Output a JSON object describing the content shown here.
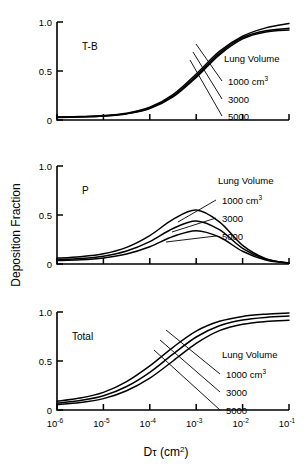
{
  "figure": {
    "y_axis_label": "Deposition Fraction",
    "x_axis_label_main": "D",
    "x_axis_label_tau": "τ",
    "x_axis_label_units_open": "(cm",
    "x_axis_label_units_exp": "2",
    "x_axis_label_units_close": ")"
  },
  "legend": {
    "title": "Lung Volume",
    "items": [
      {
        "label": "1000 cm",
        "sup": "3"
      },
      {
        "label": "3000",
        "sup": ""
      },
      {
        "label": "5000",
        "sup": ""
      }
    ]
  },
  "y_ticks": [
    "1.0",
    "0.5",
    "0"
  ],
  "x_ticks": [
    {
      "base": "10",
      "exp": "-6"
    },
    {
      "base": "10",
      "exp": "-5"
    },
    {
      "base": "10",
      "exp": "-4"
    },
    {
      "base": "10",
      "exp": "-3"
    },
    {
      "base": "10",
      "exp": "-2"
    },
    {
      "base": "10",
      "exp": "-1"
    }
  ],
  "panels": [
    {
      "name": "T-B",
      "label": "T-B"
    },
    {
      "name": "P",
      "label": "P"
    },
    {
      "name": "Total",
      "label": "Total"
    }
  ],
  "colors": {
    "line": "#000000",
    "axis": "#000000",
    "background": "#ffffff"
  },
  "chart_data": {
    "type": "line",
    "title": "",
    "xlabel": "Dτ (cm2)",
    "ylabel": "Deposition Fraction",
    "xscale": "log",
    "xlim": [
      1e-06,
      0.1
    ],
    "ylim": [
      0,
      1.0
    ],
    "xtick_values": [
      1e-06,
      1e-05,
      0.0001,
      0.001,
      0.01,
      0.1
    ],
    "ytick_values": [
      0,
      0.5,
      1.0
    ],
    "grid": false,
    "legend_position": "right-inside",
    "panels": [
      {
        "panel": "T-B",
        "annotation": "T-B",
        "x": [
          1e-06,
          3.16e-06,
          1e-05,
          3.16e-05,
          0.0001,
          0.000316,
          0.001,
          0.00316,
          0.01,
          0.0316,
          0.1
        ],
        "series": [
          {
            "name": "1000 cm3",
            "values": [
              0.03,
              0.035,
              0.045,
              0.07,
              0.13,
              0.26,
              0.47,
              0.7,
              0.855,
              0.94,
              0.985
            ]
          },
          {
            "name": "3000",
            "values": [
              0.028,
              0.033,
              0.042,
              0.065,
              0.122,
              0.245,
              0.45,
              0.68,
              0.84,
              0.91,
              0.935
            ]
          },
          {
            "name": "5000",
            "values": [
              0.026,
              0.031,
              0.04,
              0.062,
              0.116,
              0.235,
              0.435,
              0.665,
              0.828,
              0.898,
              0.918
            ]
          }
        ]
      },
      {
        "panel": "P",
        "annotation": "P",
        "x": [
          1e-06,
          3.16e-06,
          1e-05,
          3.16e-05,
          0.0001,
          0.000316,
          0.001,
          0.00316,
          0.01,
          0.0316,
          0.1
        ],
        "series": [
          {
            "name": "1000 cm3",
            "values": [
              0.06,
              0.075,
              0.105,
              0.17,
              0.29,
              0.455,
              0.55,
              0.43,
              0.19,
              0.055,
              0.01
            ]
          },
          {
            "name": "3000",
            "values": [
              0.045,
              0.056,
              0.08,
              0.132,
              0.228,
              0.362,
              0.44,
              0.35,
              0.16,
              0.048,
              0.009
            ]
          },
          {
            "name": "5000",
            "values": [
              0.035,
              0.043,
              0.062,
              0.102,
              0.176,
              0.28,
              0.34,
              0.275,
              0.13,
              0.04,
              0.008
            ]
          }
        ]
      },
      {
        "panel": "Total",
        "annotation": "Total",
        "x": [
          1e-06,
          3.16e-06,
          1e-05,
          3.16e-05,
          0.0001,
          0.000316,
          0.001,
          0.00316,
          0.01,
          0.0316,
          0.1
        ],
        "series": [
          {
            "name": "1000 cm3",
            "values": [
              0.09,
              0.122,
              0.18,
              0.29,
              0.45,
              0.64,
              0.805,
              0.905,
              0.955,
              0.978,
              0.99
            ]
          },
          {
            "name": "3000",
            "values": [
              0.07,
              0.096,
              0.145,
              0.24,
              0.385,
              0.57,
              0.745,
              0.86,
              0.918,
              0.945,
              0.958
            ]
          },
          {
            "name": "5000",
            "values": [
              0.055,
              0.076,
              0.116,
              0.196,
              0.325,
              0.5,
              0.68,
              0.81,
              0.875,
              0.903,
              0.915
            ]
          }
        ]
      }
    ]
  }
}
